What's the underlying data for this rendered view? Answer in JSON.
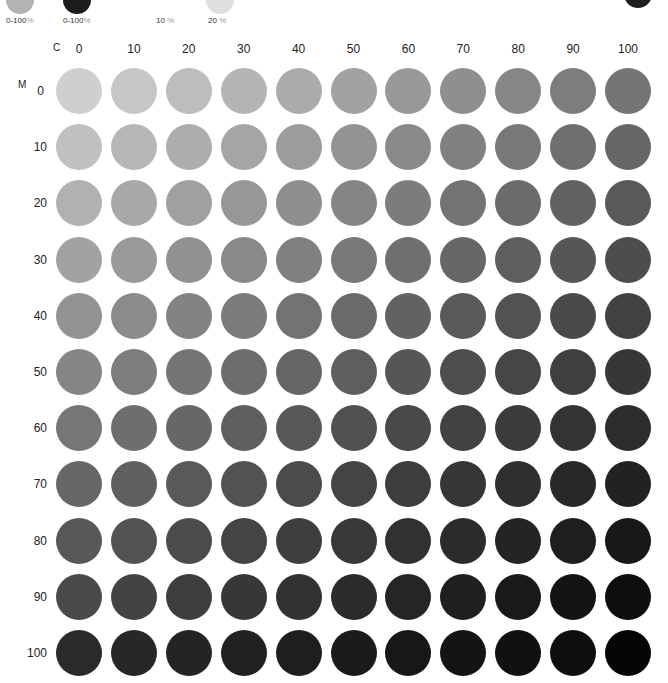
{
  "legend": {
    "items": [
      {
        "label": "0-100",
        "unit": "%",
        "swatch_color": "#b3b3b3",
        "x": 6,
        "swatch_x": 6,
        "swatch_y": -14,
        "swatch_size": 28
      },
      {
        "label": "0-100",
        "unit": "%",
        "swatch_color": "#1c1c1c",
        "x": 63,
        "swatch_x": 63,
        "swatch_y": -14,
        "swatch_size": 28
      },
      {
        "label": "10 ",
        "unit": "%",
        "swatch_color": null,
        "x": 156
      },
      {
        "label": "20 ",
        "unit": "%",
        "swatch_color": "#dedede",
        "x": 208,
        "swatch_x": 206,
        "swatch_y": -14,
        "swatch_size": 28
      }
    ],
    "corner_swatch": {
      "color": "#1e1e1e",
      "x": 624,
      "y": -20,
      "size": 28
    }
  },
  "chart_data": {
    "type": "heatmap",
    "title": "",
    "xlabel": "C",
    "ylabel": "M",
    "x": [
      0,
      10,
      20,
      30,
      40,
      50,
      60,
      70,
      80,
      90,
      100
    ],
    "y": [
      0,
      10,
      20,
      30,
      40,
      50,
      60,
      70,
      80,
      90,
      100
    ],
    "x_tick_labels": [
      "0",
      "10",
      "20",
      "30",
      "40",
      "50",
      "60",
      "70",
      "80",
      "90",
      "100"
    ],
    "y_tick_labels": [
      "0",
      "10",
      "20",
      "30",
      "40",
      "50",
      "60",
      "70",
      "80",
      "90",
      "100"
    ],
    "marker": "circle",
    "legend_labels": [
      "0-100%",
      "0-100%",
      "10 %",
      "20 %"
    ],
    "colors": [
      [
        "#cfcfcf",
        "#c6c6c6",
        "#bdbdbd",
        "#b4b4b4",
        "#ababab",
        "#a2a2a2",
        "#989898",
        "#8f8f8f",
        "#868686",
        "#7d7d7d",
        "#747474"
      ],
      [
        "#c0c0c0",
        "#b7b7b7",
        "#aeaeae",
        "#a5a5a5",
        "#9c9c9c",
        "#939393",
        "#8a8a8a",
        "#818181",
        "#787878",
        "#6f6f6f",
        "#666666"
      ],
      [
        "#b1b1b1",
        "#a8a8a8",
        "#a0a0a0",
        "#979797",
        "#8e8e8e",
        "#858585",
        "#7c7c7c",
        "#747474",
        "#6b6b6b",
        "#626262",
        "#595959"
      ],
      [
        "#a2a2a2",
        "#9a9a9a",
        "#919191",
        "#898989",
        "#808080",
        "#787878",
        "#6f6f6f",
        "#676767",
        "#5e5e5e",
        "#565656",
        "#4d4d4d"
      ],
      [
        "#939393",
        "#8b8b8b",
        "#838383",
        "#7b7b7b",
        "#737373",
        "#6a6a6a",
        "#626262",
        "#5a5a5a",
        "#525252",
        "#4a4a4a",
        "#424242"
      ],
      [
        "#858585",
        "#7d7d7d",
        "#757575",
        "#6d6d6d",
        "#656565",
        "#5e5e5e",
        "#565656",
        "#4e4e4e",
        "#464646",
        "#3f3f3f",
        "#373737"
      ],
      [
        "#767676",
        "#6e6e6e",
        "#676767",
        "#5f5f5f",
        "#585858",
        "#515151",
        "#494949",
        "#424242",
        "#3b3b3b",
        "#333333",
        "#2c2c2c"
      ],
      [
        "#676767",
        "#606060",
        "#595959",
        "#525252",
        "#4b4b4b",
        "#444444",
        "#3d3d3d",
        "#363636",
        "#2f2f2f",
        "#282828",
        "#222222"
      ],
      [
        "#585858",
        "#525252",
        "#4b4b4b",
        "#444444",
        "#3e3e3e",
        "#383838",
        "#313131",
        "#2b2b2b",
        "#242424",
        "#1e1e1e",
        "#181818"
      ],
      [
        "#494949",
        "#434343",
        "#3d3d3d",
        "#373737",
        "#313131",
        "#2b2b2b",
        "#252525",
        "#1f1f1f",
        "#191919",
        "#131313",
        "#0e0e0e"
      ],
      [
        "#2a2a2a",
        "#272727",
        "#242424",
        "#212121",
        "#1e1e1e",
        "#1b1b1b",
        "#171717",
        "#141414",
        "#111111",
        "#0e0e0e",
        "#050505"
      ]
    ],
    "grid": false
  },
  "layout": {
    "col_x0": 56,
    "col_step": 54.9,
    "row_y0": 68,
    "row_step": 56.2,
    "dot_size": 46
  }
}
